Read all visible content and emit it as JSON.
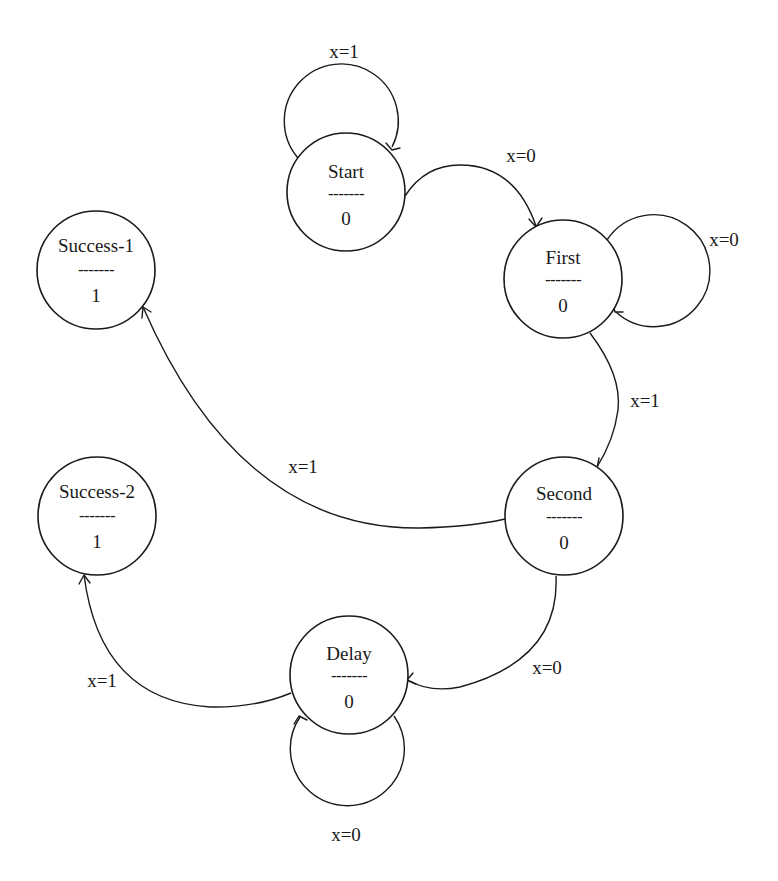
{
  "diagram": {
    "type": "state-machine",
    "kind": "Moore machine",
    "colors": {
      "stroke": "#1a1a1a",
      "background": "#ffffff"
    },
    "states": [
      {
        "id": "start",
        "name": "Start",
        "separator": "-------",
        "output": "0"
      },
      {
        "id": "first",
        "name": "First",
        "separator": "-------",
        "output": "0"
      },
      {
        "id": "second",
        "name": "Second",
        "separator": "-------",
        "output": "0"
      },
      {
        "id": "delay",
        "name": "Delay",
        "separator": "-------",
        "output": "0"
      },
      {
        "id": "success_1",
        "name": "Success-1",
        "separator": "-------",
        "output": "1"
      },
      {
        "id": "success_2",
        "name": "Success-2",
        "separator": "-------",
        "output": "1"
      }
    ],
    "transitions": [
      {
        "id": "start_self",
        "from": "Start",
        "to": "Start",
        "label": "x=1"
      },
      {
        "id": "start_to_first",
        "from": "Start",
        "to": "First",
        "label": "x=0"
      },
      {
        "id": "first_self",
        "from": "First",
        "to": "First",
        "label": "x=0"
      },
      {
        "id": "first_to_second",
        "from": "First",
        "to": "Second",
        "label": "x=1"
      },
      {
        "id": "second_to_success1",
        "from": "Second",
        "to": "Success-1",
        "label": "x=1"
      },
      {
        "id": "second_to_delay",
        "from": "Second",
        "to": "Delay",
        "label": "x=0"
      },
      {
        "id": "delay_self",
        "from": "Delay",
        "to": "Delay",
        "label": "x=0"
      },
      {
        "id": "delay_to_success2",
        "from": "Delay",
        "to": "Success-2",
        "label": "x=1"
      }
    ]
  }
}
